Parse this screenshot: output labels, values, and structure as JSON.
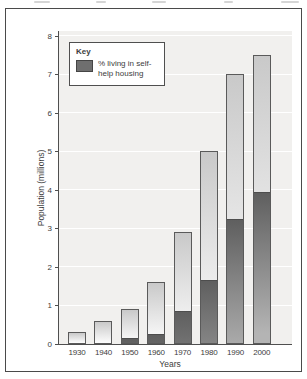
{
  "frame": {
    "background": "#ffffff",
    "border_color": "#4a4a4a"
  },
  "chart_data": {
    "type": "bar",
    "stacked": true,
    "title": "",
    "xlabel": "Years",
    "ylabel": "Population (millions)",
    "ylim": [
      0,
      8
    ],
    "yticks": [
      0,
      1,
      2,
      3,
      4,
      5,
      6,
      7,
      8
    ],
    "grid": "horizontal white gridlines on light gray plot background",
    "legend_position": "top-left inside plot area",
    "categories": [
      "1930",
      "1940",
      "1950",
      "1960",
      "1970",
      "1980",
      "1990",
      "2000"
    ],
    "series": [
      {
        "name": "Total population",
        "values": [
          0.3,
          0.6,
          0.9,
          1.6,
          2.9,
          5.0,
          7.0,
          7.5
        ]
      },
      {
        "name": "% living in self-help housing",
        "values": [
          0,
          0,
          0.1,
          0.2,
          0.8,
          1.6,
          3.2,
          3.9
        ]
      }
    ]
  },
  "legend": {
    "title": "Key",
    "items": [
      {
        "label": "% living in self-help housing",
        "swatch_color": "#6f6f6f"
      }
    ]
  },
  "colors": {
    "plot_background": "#f1f0ee",
    "gridline": "#ffffff",
    "axis": "#4f4f4f",
    "bar_border": "#5a5a5a",
    "bar_light_top": "#c9c9c9",
    "bar_light_bottom": "#fdfdfd",
    "bar_dark_top": "#5f5f5f",
    "bar_dark_bottom": "#b4b4b4",
    "text": "#3d3d3d"
  }
}
